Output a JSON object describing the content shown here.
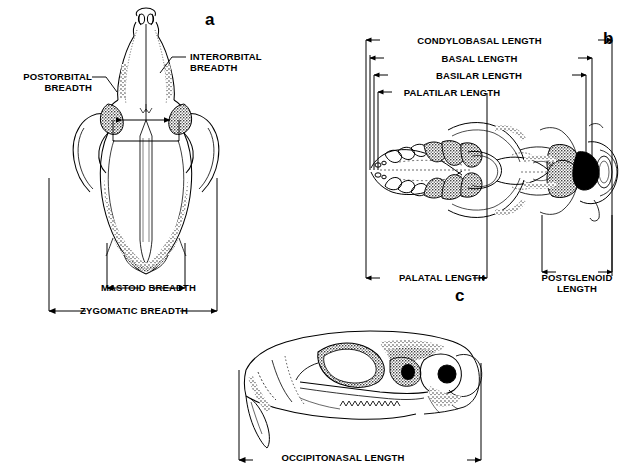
{
  "figure": {
    "background_color": "#ffffff",
    "ink_color": "#000000"
  },
  "panels": [
    {
      "id": "a",
      "letter": "a",
      "view": "dorsal-skull",
      "measurements": [
        {
          "name": "postorbital-breadth",
          "label": "POSTORBITAL\nBREADTH"
        },
        {
          "name": "interorbital-breadth",
          "label": "INTERORBITAL\nBREADTH"
        },
        {
          "name": "mastoid-breadth",
          "label": "MASTOID BREADTH"
        },
        {
          "name": "zygomatic-breadth",
          "label": "ZYGOMATIC BREADTH"
        }
      ]
    },
    {
      "id": "b",
      "letter": "b",
      "view": "ventral-skull",
      "measurements": [
        {
          "name": "condylobasal-length",
          "label": "CONDYLOBASAL LENGTH"
        },
        {
          "name": "basal-length",
          "label": "BASAL LENGTH"
        },
        {
          "name": "basilar-length",
          "label": "BASILAR LENGTH"
        },
        {
          "name": "palatilar-length",
          "label": "PALATILAR LENGTH"
        },
        {
          "name": "palatal-length",
          "label": "PALATAL LENGTH"
        },
        {
          "name": "postglenoid-length",
          "label": "POSTGLENOID\nLENGTH"
        }
      ]
    },
    {
      "id": "c",
      "letter": "c",
      "view": "lateral-skull",
      "measurements": [
        {
          "name": "occipitonasal-length",
          "label": "OCCIPITONASAL LENGTH"
        }
      ]
    }
  ],
  "labels": {
    "postorbital_breadth": "POSTORBITAL\nBREADTH",
    "interorbital_breadth": "INTERORBITAL\nBREADTH",
    "mastoid_breadth": "MASTOID BREADTH",
    "zygomatic_breadth": "ZYGOMATIC BREADTH",
    "condylobasal_length": "CONDYLOBASAL LENGTH",
    "basal_length": "BASAL LENGTH",
    "basilar_length": "BASILAR LENGTH",
    "palatilar_length": "PALATILAR LENGTH",
    "palatal_length": "PALATAL LENGTH",
    "postglenoid_length": "POSTGLENOID\nLENGTH",
    "occipitonasal_length": "OCCIPITONASAL LENGTH",
    "panel_a": "a",
    "panel_b": "b",
    "panel_c": "c"
  }
}
